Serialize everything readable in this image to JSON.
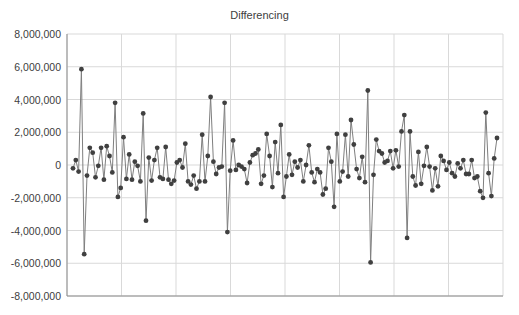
{
  "chart_data": {
    "type": "line",
    "title": "Differencing",
    "xlabel": "",
    "ylabel": "",
    "ylim": [
      -8000000,
      8000000
    ],
    "yticks": [
      8000000,
      6000000,
      4000000,
      2000000,
      0,
      -2000000,
      -4000000,
      -6000000,
      -8000000
    ],
    "ytick_labels": [
      "8,000,000",
      "6,000,000",
      "4,000,000",
      "2,000,000",
      "0",
      "-2,000,000",
      "-4,000,000",
      "-6,000,000",
      "-8,000,000"
    ],
    "x_gridlines": 8,
    "grid": true,
    "legend": "none",
    "marker": "circle",
    "series": [
      {
        "name": "Differencing",
        "color": "#404040",
        "values": [
          -200000,
          300000,
          -400000,
          5850000,
          -5450000,
          -650000,
          1050000,
          750000,
          -750000,
          -50000,
          1050000,
          -900000,
          1150000,
          550000,
          -450000,
          3800000,
          -1950000,
          -1400000,
          1700000,
          -850000,
          650000,
          -900000,
          200000,
          -50000,
          -1000000,
          3150000,
          -3400000,
          450000,
          -950000,
          300000,
          1050000,
          -750000,
          -850000,
          1100000,
          -900000,
          -1150000,
          -950000,
          150000,
          300000,
          -150000,
          1300000,
          -1000000,
          -1200000,
          -650000,
          -1450000,
          -1000000,
          1850000,
          -1000000,
          550000,
          4150000,
          200000,
          -550000,
          -150000,
          -100000,
          3800000,
          -4100000,
          -350000,
          1500000,
          -300000,
          0,
          -100000,
          -250000,
          -1100000,
          150000,
          600000,
          700000,
          950000,
          -1150000,
          -650000,
          1900000,
          550000,
          -1350000,
          1400000,
          -500000,
          2450000,
          -1950000,
          -700000,
          650000,
          -600000,
          200000,
          -150000,
          300000,
          -1000000,
          0,
          1200000,
          -450000,
          -1050000,
          -250000,
          -450000,
          -1800000,
          -1450000,
          1050000,
          200000,
          -2550000,
          1900000,
          -1000000,
          -400000,
          1850000,
          -700000,
          2750000,
          1250000,
          -250000,
          -800000,
          500000,
          -1050000,
          4550000,
          -5950000,
          -600000,
          1550000,
          850000,
          700000,
          150000,
          250000,
          850000,
          -200000,
          900000,
          -100000,
          2050000,
          3050000,
          -4450000,
          2050000,
          -700000,
          -1250000,
          800000,
          -1150000,
          -50000,
          1100000,
          -100000,
          -1550000,
          -200000,
          -1300000,
          550000,
          250000,
          -300000,
          150000,
          -500000,
          -700000,
          100000,
          -200000,
          300000,
          -550000,
          -550000,
          300000,
          -800000,
          -700000,
          -1600000,
          -2000000,
          3200000,
          -500000,
          -1900000,
          400000,
          1650000
        ]
      }
    ]
  }
}
